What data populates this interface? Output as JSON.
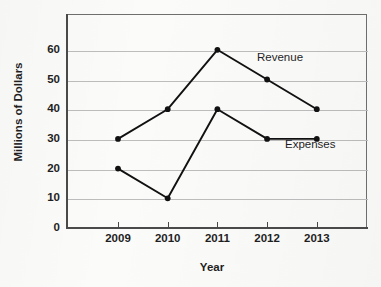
{
  "chart_data": {
    "type": "line",
    "title": "",
    "xlabel": "Year",
    "ylabel": "Millions of Dollars",
    "categories": [
      "2009",
      "2010",
      "2011",
      "2012",
      "2013"
    ],
    "x": [
      2009,
      2010,
      2011,
      2012,
      2013
    ],
    "series": [
      {
        "name": "Revenue",
        "values": [
          30,
          40,
          60,
          50,
          40
        ]
      },
      {
        "name": "Expenses",
        "values": [
          20,
          10,
          40,
          30,
          30
        ]
      }
    ],
    "ylim": [
      0,
      65
    ],
    "yticks": [
      0,
      10,
      20,
      30,
      40,
      50,
      60
    ],
    "ytick_labels": [
      "0",
      "10",
      "20",
      "30",
      "40",
      "50",
      "60"
    ],
    "xtick_labels": [
      "2009",
      "2010",
      "2011",
      "2012",
      "2013"
    ],
    "grid": "horizontal",
    "legend_position": "inline-annotations",
    "annotations": [
      {
        "text": "Revenue",
        "series": "Revenue"
      },
      {
        "text": "Expenses",
        "series": "Expenses"
      }
    ],
    "colors": {
      "line": "#111111",
      "marker": "#111111",
      "grid": "#bdbdbd",
      "axis": "#4a4a4a",
      "background": "#fbfbfa",
      "text": "#1f1f1f"
    }
  }
}
